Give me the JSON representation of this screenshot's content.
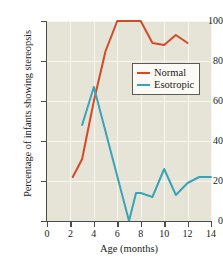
{
  "chart_data": {
    "type": "line",
    "title": "",
    "xlabel": "Age (months)",
    "ylabel": "Percentage of infants showing stereopsis",
    "xlim": [
      0,
      14
    ],
    "ylim": [
      0,
      100
    ],
    "xticks": [
      0,
      2,
      4,
      6,
      8,
      10,
      12,
      14
    ],
    "yticks": [
      0,
      20,
      40,
      60,
      80,
      100
    ],
    "grid": true,
    "legend_position": "upper right",
    "background_color": "#e6e4d6",
    "gridline_color": "#f7f6ef",
    "series": [
      {
        "name": "Normal",
        "color": "#d24a28",
        "x": [
          2.2,
          3.0,
          4.0,
          5.0,
          6.0,
          7.0,
          8.0,
          9.0,
          10.0,
          11.0,
          12.0
        ],
        "values": [
          22,
          31,
          60,
          85,
          100,
          100,
          100,
          89,
          88,
          93,
          89
        ]
      },
      {
        "name": "Esotropic",
        "color": "#3ba3b8",
        "x": [
          3.0,
          4.0,
          7.0,
          7.6,
          8.0,
          9.0,
          10.0,
          11.0,
          12.0,
          13.0,
          14.0
        ],
        "values": [
          48,
          67,
          0,
          14,
          14,
          12,
          26,
          13,
          19,
          22,
          22
        ]
      }
    ]
  },
  "axis": {
    "x_tick_labels": [
      "0",
      "2",
      "4",
      "6",
      "8",
      "10",
      "12",
      "14"
    ],
    "y_tick_labels": [
      "0",
      "20",
      "40",
      "60",
      "80",
      "100"
    ],
    "x_title": "Age (months)",
    "y_title": "Percentage of infants showing stereopsis"
  },
  "legend": {
    "entries": [
      {
        "label": "Normal",
        "color": "#d24a28"
      },
      {
        "label": "Esotropic",
        "color": "#3ba3b8"
      }
    ]
  }
}
